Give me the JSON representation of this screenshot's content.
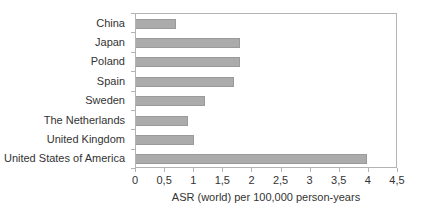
{
  "chart_data": {
    "type": "bar",
    "orientation": "horizontal",
    "title": "",
    "xlabel": "ASR (world) per 100,000 person-years",
    "ylabel": "",
    "categories": [
      "China",
      "Japan",
      "Poland",
      "Spain",
      "Sweden",
      "The Netherlands",
      "United Kingdom",
      "United States of America"
    ],
    "values": [
      0.7,
      1.8,
      1.8,
      1.7,
      1.2,
      0.9,
      1.0,
      4.0
    ],
    "xlim": [
      0,
      4.5
    ],
    "xticks": [
      0,
      0.5,
      1,
      1.5,
      2,
      2.5,
      3,
      3.5,
      4,
      4.5
    ],
    "xtick_labels": [
      "0",
      "0,5",
      "1",
      "1,5",
      "2",
      "2,5",
      "3",
      "3,5",
      "4",
      "4,5"
    ],
    "grid": false,
    "legend": false,
    "colors": {
      "background": "#ffffff",
      "bar_fill": "#ababab",
      "bar_border": "#9a9a9a",
      "axis_line": "#b3b3b3",
      "text": "#333333"
    }
  }
}
